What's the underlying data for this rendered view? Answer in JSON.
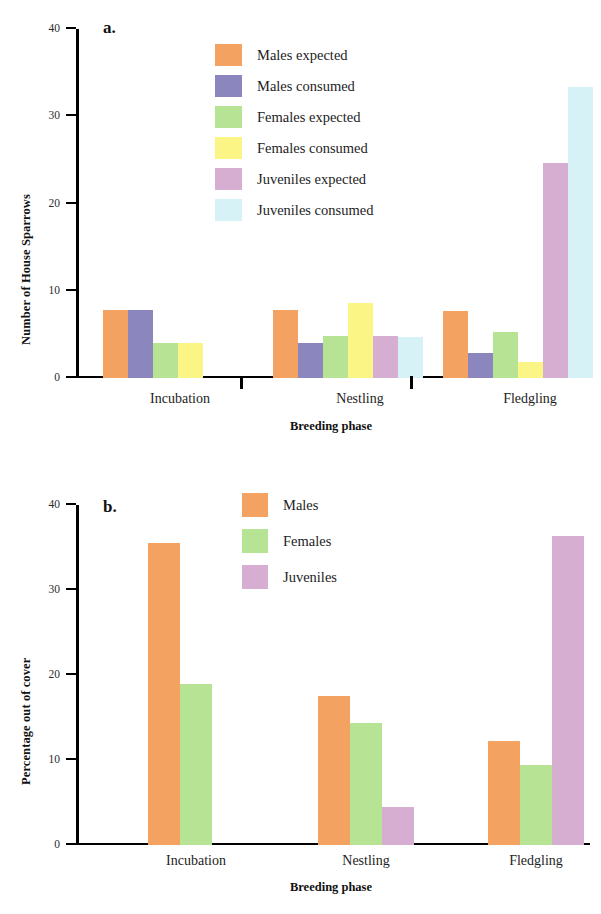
{
  "figure_a": {
    "panel_tag": "a.",
    "ylabel": "Number of House Sparrows",
    "xlabel": "Breeding phase",
    "yticks": [
      "40",
      "30",
      "20",
      "10",
      "0"
    ],
    "groups": [
      "Incubation",
      "Nestling",
      "Fledgling"
    ],
    "legend": [
      {
        "label": "Males expected",
        "color": "#f4a261"
      },
      {
        "label": "Males consumed",
        "color": "#8b86bd"
      },
      {
        "label": "Females expected",
        "color": "#b7e394"
      },
      {
        "label": "Females consumed",
        "color": "#fbf585"
      },
      {
        "label": "Juveniles expected",
        "color": "#d6aed2"
      },
      {
        "label": "Juveniles consumed",
        "color": "#d6f2f7"
      }
    ]
  },
  "figure_b": {
    "panel_tag": "b.",
    "ylabel": "Percentage out of cover",
    "xlabel": "Breeding phase",
    "yticks": [
      "40",
      "30",
      "20",
      "10",
      "0"
    ],
    "groups": [
      "Incubation",
      "Nestling",
      "Fledgling"
    ],
    "legend": [
      {
        "label": "Males",
        "color": "#f4a261"
      },
      {
        "label": "Females",
        "color": "#b7e394"
      },
      {
        "label": "Juveniles",
        "color": "#d6aed2"
      }
    ]
  },
  "chart_data": [
    {
      "type": "bar",
      "panel": "a",
      "title": "Number of House Sparrows by breeding phase",
      "xlabel": "Breeding phase",
      "ylabel": "Number of House Sparrows",
      "ylim": [
        0,
        40
      ],
      "yticks": [
        0,
        10,
        20,
        30,
        40
      ],
      "grid": false,
      "legend_position": "upper-center",
      "categories": [
        "Incubation",
        "Nestling",
        "Fledgling"
      ],
      "series": [
        {
          "name": "Males expected",
          "color": "#f4a261",
          "values": [
            7.8,
            7.8,
            7.7
          ]
        },
        {
          "name": "Males consumed",
          "color": "#8b86bd",
          "values": [
            7.8,
            4.0,
            2.9
          ]
        },
        {
          "name": "Females expected",
          "color": "#b7e394",
          "values": [
            4.0,
            4.8,
            5.3
          ]
        },
        {
          "name": "Females consumed",
          "color": "#fbf585",
          "values": [
            4.0,
            8.6,
            1.8
          ]
        },
        {
          "name": "Juveniles expected",
          "color": "#d6aed2",
          "values": [
            0.0,
            4.8,
            24.6
          ]
        },
        {
          "name": "Juveniles consumed",
          "color": "#d6f2f7",
          "values": [
            0.0,
            4.7,
            33.3
          ]
        }
      ]
    },
    {
      "type": "bar",
      "panel": "b",
      "title": "Percentage out of cover by breeding phase",
      "xlabel": "Breeding phase",
      "ylabel": "Percentage out of cover",
      "ylim": [
        0,
        40
      ],
      "yticks": [
        0,
        10,
        20,
        30,
        40
      ],
      "grid": false,
      "legend_position": "upper-center",
      "categories": [
        "Incubation",
        "Nestling",
        "Fledgling"
      ],
      "series": [
        {
          "name": "Males",
          "color": "#f4a261",
          "values": [
            35.5,
            17.5,
            12.2
          ]
        },
        {
          "name": "Females",
          "color": "#b7e394",
          "values": [
            19.0,
            14.3,
            9.4
          ]
        },
        {
          "name": "Juveniles",
          "color": "#d6aed2",
          "values": [
            0.0,
            4.5,
            36.4
          ]
        }
      ]
    }
  ]
}
